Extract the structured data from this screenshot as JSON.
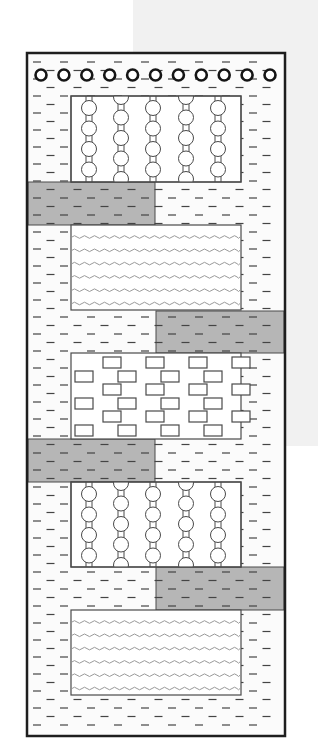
{
  "canvas": {
    "width": 318,
    "height": 753
  },
  "colors": {
    "page_bg": "#ffffff",
    "side_patch": "#f1f1f1",
    "frame_stroke": "#1e1e1e",
    "box_stroke": "#4a4a4a",
    "band_fill": "#b6b6b6",
    "box_fill": "#ffffff",
    "column_fill": "#fbfbfb",
    "dash": "#444444",
    "wave": "#9a9a9a",
    "circle_ring": "#151515"
  },
  "side_patch": {
    "x": 133,
    "y": 0,
    "w": 185,
    "h": 446
  },
  "frame": {
    "x": 27,
    "y": 53,
    "w": 258,
    "h": 683,
    "stroke_width": 2.5
  },
  "dash_pattern": {
    "row_spacing": 8.5,
    "col_spacing": 27,
    "dash_len": 8,
    "start_y": 62,
    "end_y": 730,
    "start_x": 33
  },
  "top_circle_row": {
    "y": 75,
    "x_start": 41,
    "spacing": 22.9,
    "count": 11,
    "radius": 5.5,
    "ring_width": 2.6
  },
  "layers": [
    {
      "id": "pillar-box-1",
      "kind": "pillars",
      "x": 71,
      "y": 96,
      "w": 170,
      "h": 86
    },
    {
      "id": "band-1",
      "kind": "band",
      "x": 28,
      "y": 182,
      "w": 127,
      "h": 43
    },
    {
      "id": "wave-box-1",
      "kind": "waves",
      "x": 71,
      "y": 225,
      "w": 170,
      "h": 85
    },
    {
      "id": "band-2",
      "kind": "band",
      "x": 156,
      "y": 311,
      "w": 128,
      "h": 42
    },
    {
      "id": "brick-box",
      "kind": "bricks",
      "x": 71,
      "y": 353,
      "w": 170,
      "h": 86
    },
    {
      "id": "band-3",
      "kind": "band",
      "x": 28,
      "y": 439,
      "w": 127,
      "h": 43
    },
    {
      "id": "pillar-box-2",
      "kind": "pillars",
      "x": 71,
      "y": 482,
      "w": 170,
      "h": 85
    },
    {
      "id": "band-4",
      "kind": "band",
      "x": 156,
      "y": 567,
      "w": 128,
      "h": 43
    },
    {
      "id": "wave-box-2",
      "kind": "waves",
      "x": 71,
      "y": 610,
      "w": 170,
      "h": 85
    }
  ],
  "pillars": {
    "x_positions": [
      89,
      121,
      153,
      186,
      218
    ],
    "phase": [
      0,
      1,
      0,
      1,
      0
    ],
    "circle_r": 7.5,
    "stem_w": 6,
    "circle_step": 20.5
  },
  "waves": {
    "count": 6,
    "first_offset": 12,
    "spacing": 13.3,
    "amplitude": 1.3,
    "wavelength": 10
  },
  "bricks": {
    "w": 18,
    "h": 11,
    "row_starts": [
      357,
      371,
      384,
      398,
      411,
      425
    ],
    "even_row_x": [
      103,
      146,
      189,
      232
    ],
    "odd_row_x": [
      75,
      118,
      161,
      204
    ]
  }
}
